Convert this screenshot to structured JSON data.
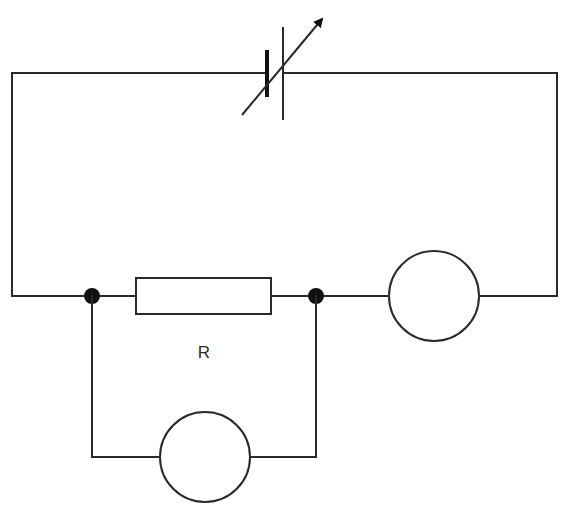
{
  "diagram": {
    "type": "circuit",
    "components": [
      {
        "id": "supply",
        "kind": "variable-dc-supply",
        "label": ""
      },
      {
        "id": "resistor",
        "kind": "resistor",
        "label": "R"
      },
      {
        "id": "meter-series",
        "kind": "meter",
        "label": ""
      },
      {
        "id": "meter-parallel",
        "kind": "meter",
        "label": ""
      }
    ],
    "junctions": 2,
    "labels": {
      "resistor": "R"
    },
    "colors": {
      "line": "#2a2a2a",
      "background": "#ffffff"
    }
  }
}
